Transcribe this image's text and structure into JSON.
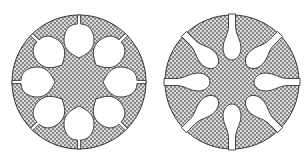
{
  "figure": {
    "panels": [
      {
        "id": "left",
        "cavity_shape": "round-lobes",
        "cavity_count": 8,
        "center": [
          79,
          82
        ],
        "radius": 67
      },
      {
        "id": "right",
        "cavity_shape": "teardrop-slots",
        "cavity_count": 8,
        "center": [
          232,
          82
        ],
        "radius": 67
      }
    ],
    "colors": {
      "outline": "#333333",
      "hatch_dark": "#8a8a8a",
      "hatch_light": "#d9d9d9",
      "background": "#ffffff"
    }
  }
}
